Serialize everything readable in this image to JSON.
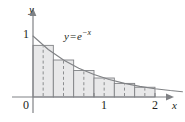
{
  "figure": {
    "name": "midpoint-rule-riemann-sum-diagram",
    "background_color": "#ffffff"
  },
  "axes": {
    "x_axis_label": "x",
    "y_axis_label": "y",
    "origin_label": "0",
    "x_ticks": [
      {
        "value": 1,
        "label": "1"
      },
      {
        "value": 2,
        "label": "2"
      }
    ],
    "y_ticks": [
      {
        "value": 1,
        "label": "1"
      }
    ],
    "x_range": [
      0,
      2.45
    ],
    "y_range": [
      0,
      1.18
    ],
    "axis_color": "#808285",
    "tick_color": "#808285"
  },
  "curve": {
    "label_base": "y",
    "label_operator": "=",
    "label_function": "e",
    "label_exponent": "−x",
    "equation": "y = e^{-x}",
    "color": "#808285",
    "stroke_width": 1.1,
    "x_start": 0,
    "x_end": 2.45
  },
  "chart_data": {
    "type": "area",
    "title": "",
    "subtitle": "",
    "xlabel": "x",
    "ylabel": "y",
    "xlim": [
      0,
      2.45
    ],
    "ylim": [
      0,
      1.18
    ],
    "grid": false,
    "legend": "none",
    "annotations": [
      "y = e^{-x}"
    ],
    "function": "y = e^(-x)",
    "method": "midpoint rule",
    "n_rectangles": 6,
    "interval": [
      0,
      2
    ],
    "delta_x": 0.3333,
    "rectangles": [
      {
        "index": 1,
        "x_left": 0.0,
        "x_right": 0.3333,
        "midpoint": 0.1667,
        "height": 0.8465
      },
      {
        "index": 2,
        "x_left": 0.3333,
        "x_right": 0.6667,
        "midpoint": 0.5,
        "height": 0.6065
      },
      {
        "index": 3,
        "x_left": 0.6667,
        "x_right": 1.0,
        "midpoint": 0.8333,
        "height": 0.4346
      },
      {
        "index": 4,
        "x_left": 1.0,
        "x_right": 1.3333,
        "midpoint": 1.1667,
        "height": 0.3114
      },
      {
        "index": 5,
        "x_left": 1.3333,
        "x_right": 1.6667,
        "midpoint": 1.5,
        "height": 0.2231
      },
      {
        "index": 6,
        "x_left": 1.6667,
        "x_right": 2.0,
        "midpoint": 1.8333,
        "height": 0.1599
      }
    ],
    "curve_points_x": [
      0,
      0.25,
      0.5,
      0.75,
      1.0,
      1.25,
      1.5,
      1.75,
      2.0,
      2.25,
      2.45
    ],
    "curve_points_y": [
      1.0,
      0.7788,
      0.6065,
      0.4724,
      0.3679,
      0.2865,
      0.2231,
      0.1738,
      0.1353,
      0.1054,
      0.0863
    ],
    "rect_fill_color": "#e8e8e9",
    "rect_stroke_color": "#808285",
    "midline_style": "dashed",
    "midline_color": "#808285"
  }
}
